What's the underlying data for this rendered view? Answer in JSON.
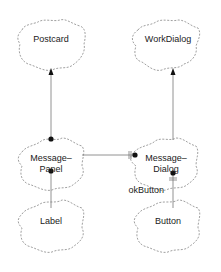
{
  "diagram": {
    "classes": [
      {
        "id": "postcard",
        "label": "Postcard"
      },
      {
        "id": "workdialog",
        "label": "WorkDialog"
      },
      {
        "id": "messagepanel",
        "label_line1": "Message–",
        "label_line2": "Panel"
      },
      {
        "id": "messagedialog",
        "label_line1": "Message–",
        "label_line2": "Dialog"
      },
      {
        "id": "label",
        "label": "Label"
      },
      {
        "id": "button",
        "label": "Button"
      }
    ],
    "relations": [
      {
        "from": "MessagePanel",
        "to": "Postcard",
        "type": "has-by-value arrow"
      },
      {
        "from": "MessageDialog",
        "to": "WorkDialog",
        "type": "inheritance arrow"
      },
      {
        "from": "MessagePanel",
        "to": "MessageDialog",
        "type": "has with cardinality"
      },
      {
        "from": "MessagePanel",
        "to": "Label",
        "type": "has"
      },
      {
        "from": "MessageDialog",
        "to": "Button",
        "type": "has",
        "label": "okButton"
      }
    ],
    "edge_label_okbutton": "okButton"
  }
}
